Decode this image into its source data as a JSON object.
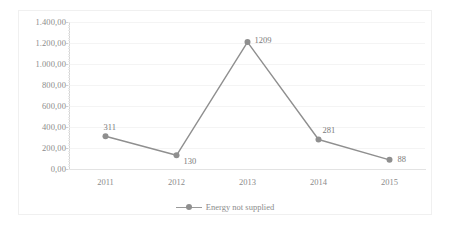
{
  "chart_data": {
    "type": "line",
    "title": "",
    "subtitle": "",
    "xlabel": "",
    "ylabel": "",
    "categories": [
      "2011",
      "2012",
      "2013",
      "2014",
      "2015"
    ],
    "series": [
      {
        "name": "Energy not supplied",
        "values": [
          311,
          130,
          1209,
          281,
          88
        ],
        "point_labels": [
          "311",
          "130",
          "1209",
          "281",
          "88"
        ],
        "color": "#8f8f8f",
        "marker": "circle"
      }
    ],
    "ylim": [
      0,
      1400
    ],
    "ytick_values": [
      0,
      200,
      400,
      600,
      800,
      1000,
      1200,
      1400
    ],
    "ytick_labels": [
      "0,00",
      "200,00",
      "400,00",
      "600,00",
      "800,00",
      "1.000,00",
      "1.200,00",
      "1.400,00"
    ],
    "xtick_labels": [
      "2011",
      "2012",
      "2013",
      "2014",
      "2015"
    ],
    "grid": true,
    "grid_axis": "y",
    "legend": [
      "Energy not supplied"
    ],
    "legend_position": "bottom",
    "annotations": []
  },
  "legend": {
    "entry_label": "Energy not supplied"
  },
  "colors": {
    "series": "#8f8f8f",
    "grid": "#f4f4f4",
    "axis": "#d6d6d6",
    "text": "#8c8c8c",
    "border": "#f0f0f0",
    "background": "#ffffff"
  }
}
